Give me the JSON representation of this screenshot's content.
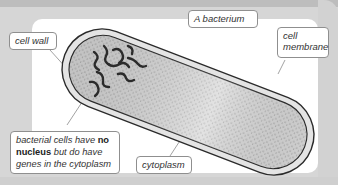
{
  "diagram": {
    "title": "A bacterium",
    "labels": {
      "cell_wall": "cell wall",
      "cell_membrane_line1": "cell",
      "cell_membrane_line2": "membrane",
      "cytoplasm": "cytoplasm",
      "nucleus_note_part1": "bacterial cells have ",
      "nucleus_note_bold1": "no",
      "nucleus_note_bold2": "nucleus",
      "nucleus_note_part2": " but do have",
      "nucleus_note_part3": "genes in the cytoplasm"
    },
    "colors": {
      "frame": "#d6d6d6",
      "panel": "#ffffff",
      "cell_wall": "#e2e2e2",
      "cytoplasm": "#bdbdbd",
      "outline": "#2a2a2a",
      "genes": "#2a2a2a"
    }
  }
}
